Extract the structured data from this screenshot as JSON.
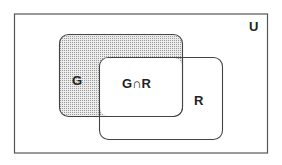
{
  "diagram": {
    "type": "venn",
    "universe": {
      "label": "U"
    },
    "sets": [
      {
        "id": "G",
        "label": "G",
        "shaded": true
      },
      {
        "id": "R",
        "label": "R",
        "shaded": false
      }
    ],
    "intersection": {
      "label": "G∩R"
    },
    "colors": {
      "stroke": "#444444",
      "shade_dot": "#8a8a8a",
      "background": "#ffffff"
    }
  }
}
